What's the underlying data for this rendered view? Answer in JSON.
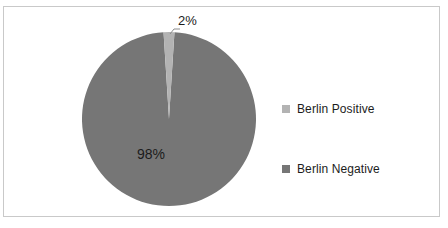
{
  "chart_data": {
    "type": "pie",
    "title": "",
    "categories": [
      "Berlin Positive",
      "Berlin Negative"
    ],
    "values": [
      2,
      98
    ],
    "data_labels": [
      "2%",
      "98%"
    ],
    "units": "percent",
    "legend_position": "right",
    "grid": false,
    "colors": {
      "berlin_positive": "#b3b3b3",
      "berlin_negative": "#767676",
      "label_text": "#1c1c1c",
      "frame_border": "#c9c9c9",
      "leader_line": "#8c8c8c",
      "background": "#ffffff"
    },
    "series": [
      {
        "name": "Berlin Positive",
        "value": 2,
        "label": "2%",
        "color": "#b3b3b3"
      },
      {
        "name": "Berlin Negative",
        "value": 98,
        "label": "98%",
        "color": "#767676"
      }
    ]
  },
  "legend": {
    "entries": [
      {
        "label": "Berlin Positive",
        "swatch_color": "#b3b3b3"
      },
      {
        "label": "Berlin Negative",
        "swatch_color": "#767676"
      }
    ]
  },
  "labels": {
    "positive_pct": "2%",
    "negative_pct": "98%"
  }
}
